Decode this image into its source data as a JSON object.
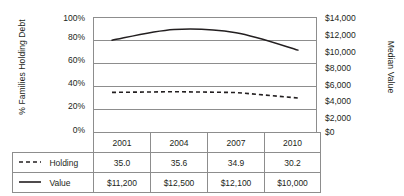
{
  "chart_data": {
    "type": "line",
    "title": "",
    "categories": [
      "2001",
      "2004",
      "2007",
      "2010"
    ],
    "x": [
      2001,
      2004,
      2007,
      2010
    ],
    "grid": true,
    "legend_position": "table-left",
    "axes": {
      "left": {
        "label": "% Families Holding Debt",
        "ticks": [
          "0%",
          "20%",
          "40%",
          "60%",
          "80%",
          "100%"
        ],
        "tick_values": [
          0,
          20,
          40,
          60,
          80,
          100
        ],
        "lim": [
          0,
          100
        ]
      },
      "right": {
        "label": "Median Value",
        "ticks": [
          "$0",
          "$2,000",
          "$4,000",
          "$6,000",
          "$8,000",
          "$10,000",
          "$12,000",
          "$14,000"
        ],
        "tick_values": [
          0,
          2000,
          4000,
          6000,
          8000,
          10000,
          12000,
          14000
        ],
        "lim": [
          0,
          14000
        ]
      },
      "xlabel": ""
    },
    "series": [
      {
        "name": "Holding",
        "label": "Holding",
        "style": "dashed",
        "axis": "left",
        "color": "#231f20",
        "values": [
          35.0,
          35.6,
          34.9,
          30.2
        ],
        "display_values": [
          "35.0",
          "35.6",
          "34.9",
          "30.2"
        ]
      },
      {
        "name": "Value",
        "label": "Value",
        "style": "solid",
        "axis": "right",
        "color": "#231f20",
        "values": [
          11200,
          12500,
          12100,
          10000
        ],
        "display_values": [
          "$11,200",
          "$12,500",
          "$12,100",
          "$10,000"
        ]
      }
    ]
  },
  "table": {
    "corner": "",
    "year_headers": [
      "2001",
      "2004",
      "2007",
      "2010"
    ],
    "rows": [
      {
        "label": "Holding",
        "key_style": "dashed",
        "cells": [
          "35.0",
          "35.6",
          "34.9",
          "30.2"
        ]
      },
      {
        "label": "Value",
        "key_style": "solid",
        "cells": [
          "$11,200",
          "$12,500",
          "$12,100",
          "$10,000"
        ]
      }
    ]
  },
  "colors": {
    "line": "#231f20",
    "grid": "#8d8d8d",
    "axis": "#6f6f6f",
    "text": "#231f20",
    "background": "#ffffff"
  }
}
